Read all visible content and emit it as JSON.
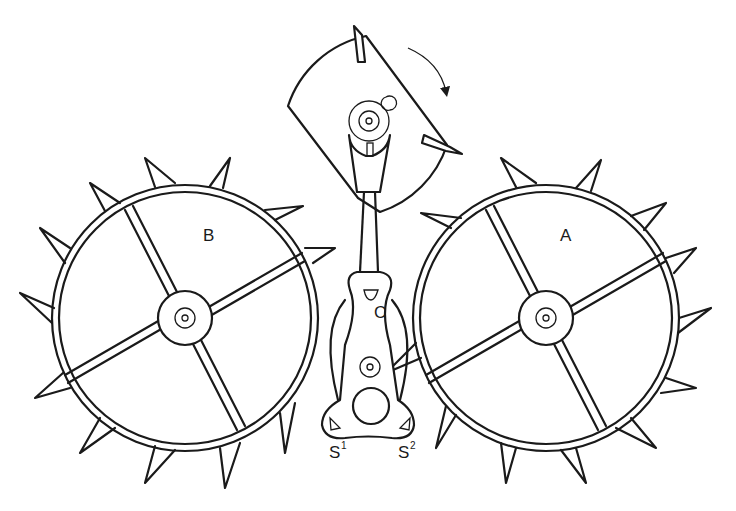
{
  "diagram": {
    "labels": {
      "wheel_left": "B",
      "wheel_right": "A",
      "pallet_center": "C",
      "stone_left": "S",
      "stone_left_sup": "1",
      "stone_right": "S",
      "stone_right_sup": "2"
    },
    "components": [
      {
        "id": "wheel-b",
        "label": "B",
        "type": "escape-wheel",
        "teeth": 15,
        "spokes": 4,
        "center": [
          185,
          318
        ],
        "radius": 133
      },
      {
        "id": "wheel-a",
        "label": "A",
        "type": "escape-wheel",
        "teeth": 15,
        "spokes": 4,
        "center": [
          546,
          318
        ],
        "radius": 133
      },
      {
        "id": "balance",
        "type": "balance-roller-with-pallets",
        "rotation_arrow": "clockwise"
      },
      {
        "id": "lever-c",
        "label": "C",
        "type": "pallet-lever"
      },
      {
        "id": "stones",
        "labels": [
          "S1",
          "S2"
        ],
        "type": "pallet-stones"
      }
    ],
    "colors": {
      "ink": "#1a1a1a",
      "paper": "#ffffff"
    }
  }
}
